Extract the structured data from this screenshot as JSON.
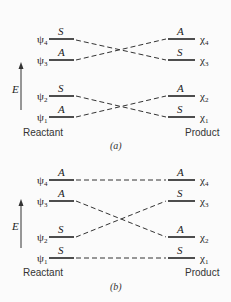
{
  "panels": [
    {
      "id": "a",
      "caption": "(a)",
      "left_label": "Reactant",
      "right_label": "Product",
      "axis_label": "E",
      "reactant_levels": [
        {
          "name": "ψ4",
          "sub": "4",
          "sym": "S"
        },
        {
          "name": "ψ3",
          "sub": "3",
          "sym": "A"
        },
        {
          "name": "ψ2",
          "sub": "2",
          "sym": "S"
        },
        {
          "name": "ψ1",
          "sub": "1",
          "sym": "A"
        }
      ],
      "product_levels": [
        {
          "name": "χ4",
          "sub": "4",
          "sym": "A"
        },
        {
          "name": "χ3",
          "sub": "3",
          "sym": "S"
        },
        {
          "name": "χ2",
          "sub": "2",
          "sym": "A"
        },
        {
          "name": "χ1",
          "sub": "1",
          "sym": "S"
        }
      ],
      "correlations": [
        [
          "ψ4",
          "χ3"
        ],
        [
          "ψ3",
          "χ4"
        ],
        [
          "ψ2",
          "χ1"
        ],
        [
          "ψ1",
          "χ2"
        ]
      ]
    },
    {
      "id": "b",
      "caption": "(b)",
      "left_label": "Reactant",
      "right_label": "Product",
      "axis_label": "E",
      "reactant_levels": [
        {
          "name": "ψ4",
          "sub": "4",
          "sym": "A"
        },
        {
          "name": "ψ3",
          "sub": "3",
          "sym": "A"
        },
        {
          "name": "ψ2",
          "sub": "2",
          "sym": "S"
        },
        {
          "name": "ψ1",
          "sub": "1",
          "sym": "S"
        }
      ],
      "product_levels": [
        {
          "name": "χ4",
          "sub": "4",
          "sym": "A"
        },
        {
          "name": "χ3",
          "sub": "3",
          "sym": "S"
        },
        {
          "name": "χ2",
          "sub": "2",
          "sym": "A"
        },
        {
          "name": "χ1",
          "sub": "1",
          "sym": "S"
        }
      ],
      "correlations": [
        [
          "ψ4",
          "χ4"
        ],
        [
          "ψ3",
          "χ2"
        ],
        [
          "ψ2",
          "χ3"
        ],
        [
          "ψ1",
          "χ1"
        ]
      ]
    }
  ],
  "glyphs": {
    "psi": "ψ",
    "chi": "χ"
  }
}
